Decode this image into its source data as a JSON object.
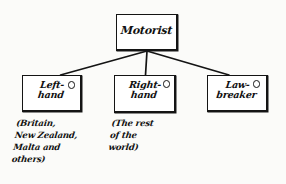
{
  "diagram": {
    "type": "tree",
    "title_node": {
      "id": "motorist",
      "label": "Motorist"
    },
    "children": [
      {
        "id": "left-hand",
        "label": "Left-\nhand",
        "mark": "small-circle",
        "caption": "(Britain,\nNew Zealand,\nMalta and\nothers)"
      },
      {
        "id": "right-hand",
        "label": "Right-\nhand",
        "mark": "small-circle",
        "caption": "(The rest\nof the\nworld)"
      },
      {
        "id": "law-breaker",
        "label": "Law-\nbreaker",
        "mark": "small-circle",
        "caption": ""
      }
    ],
    "colors": {
      "ink": "#141414",
      "paper": "#fbfbf9",
      "box_fill": "#ffffff"
    }
  }
}
